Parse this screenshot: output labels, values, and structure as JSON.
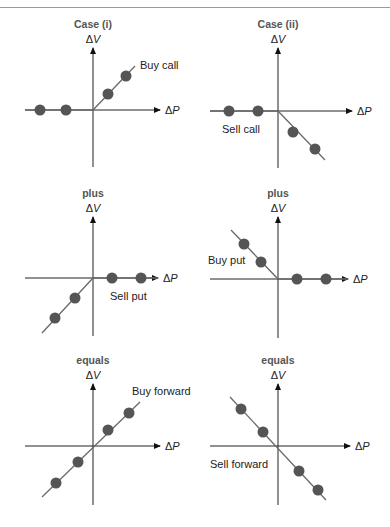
{
  "figure": {
    "colors": {
      "axis": "#222222",
      "line": "#6a6a6a",
      "dot": "#555555",
      "title": "#555555",
      "label": "#222222"
    },
    "x_axis_label": "ΔP",
    "y_axis_label": "ΔV",
    "panels": [
      {
        "id": "case-i-buy-call",
        "title": "Case (i)",
        "label": "Buy call",
        "origin": [
          93,
          110
        ],
        "xaxis": [
          25,
          160
        ],
        "yaxis": [
          48,
          167
        ],
        "line": [
          [
            25,
            110
          ],
          [
            93,
            110
          ],
          [
            135,
            66
          ]
        ],
        "dots": [
          [
            40,
            110
          ],
          [
            66,
            110
          ],
          [
            108,
            94
          ],
          [
            126,
            76
          ]
        ],
        "label_pos": [
          140,
          69
        ],
        "label_anchor": "start"
      },
      {
        "id": "case-ii-sell-call",
        "title": "Case (ii)",
        "label": "Sell call",
        "origin": [
          278,
          111
        ],
        "xaxis": [
          210,
          352
        ],
        "yaxis": [
          48,
          168
        ],
        "line": [
          [
            210,
            111
          ],
          [
            278,
            111
          ],
          [
            325,
            160
          ]
        ],
        "dots": [
          [
            229,
            111
          ],
          [
            258,
            111
          ],
          [
            293,
            132
          ],
          [
            315,
            149
          ]
        ],
        "label_pos": [
          222,
          133
        ],
        "label_anchor": "start"
      },
      {
        "id": "plus-sell-put",
        "title": "plus",
        "label": "Sell put",
        "origin": [
          93,
          278
        ],
        "xaxis": [
          25,
          158
        ],
        "yaxis": [
          217,
          336
        ],
        "line": [
          [
            42,
            333
          ],
          [
            93,
            278
          ],
          [
            158,
            278
          ]
        ],
        "dots": [
          [
            112,
            278
          ],
          [
            141,
            278
          ],
          [
            75,
            298
          ],
          [
            55,
            318
          ]
        ],
        "label_pos": [
          110,
          300
        ],
        "label_anchor": "start"
      },
      {
        "id": "plus-buy-put",
        "title": "plus",
        "label": "Buy put",
        "origin": [
          278,
          279
        ],
        "xaxis": [
          210,
          348
        ],
        "yaxis": [
          217,
          338
        ],
        "line": [
          [
            231,
            230
          ],
          [
            278,
            279
          ],
          [
            348,
            279
          ]
        ],
        "dots": [
          [
            244,
            244
          ],
          [
            261,
            262
          ],
          [
            297,
            279
          ],
          [
            326,
            279
          ]
        ],
        "label_pos": [
          208,
          264
        ],
        "label_anchor": "start"
      },
      {
        "id": "equals-buy-forward",
        "title": "equals",
        "label": "Buy forward",
        "origin": [
          93,
          446
        ],
        "xaxis": [
          25,
          160
        ],
        "yaxis": [
          384,
          505
        ],
        "line": [
          [
            42,
            497
          ],
          [
            140,
            402
          ]
        ],
        "dots": [
          [
            129,
            413
          ],
          [
            108,
            430
          ],
          [
            78,
            462
          ],
          [
            56,
            483
          ]
        ],
        "label_pos": [
          132,
          395
        ],
        "label_anchor": "start"
      },
      {
        "id": "equals-sell-forward",
        "title": "equals",
        "label": "Sell forward",
        "origin": [
          278,
          446
        ],
        "xaxis": [
          210,
          350
        ],
        "yaxis": [
          384,
          505
        ],
        "line": [
          [
            230,
            397
          ],
          [
            326,
            500
          ]
        ],
        "dots": [
          [
            241,
            409
          ],
          [
            263,
            432
          ],
          [
            299,
            471
          ],
          [
            318,
            490
          ]
        ],
        "label_pos": [
          210,
          468
        ],
        "label_anchor": "start"
      }
    ]
  }
}
